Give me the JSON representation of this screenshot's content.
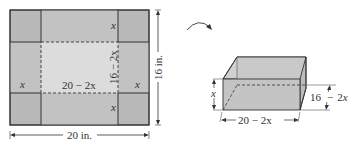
{
  "flat_sheet": {
    "corner_label": "x",
    "inner_width_label": "20 − 2x",
    "inner_height_label": "16 − 2x",
    "width_label": "20 in.",
    "height_label": "16 in.",
    "colors": {
      "outer": "#b9b9b9",
      "inner": "#dcdcdc",
      "line": "#333333"
    }
  },
  "fold_arrow": {
    "icon": "curved-arrow-icon"
  },
  "box": {
    "height_label": "x",
    "length_label": "20 − 2x",
    "depth_label": "16 − 2x",
    "colors": {
      "face": "#c4c4c4",
      "top": "#d2d2d2",
      "line": "#333333"
    }
  }
}
